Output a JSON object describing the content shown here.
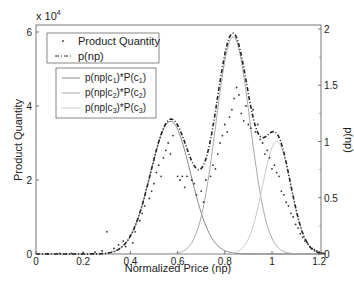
{
  "chart_data": {
    "type": "line",
    "title": "",
    "xlabel": "Normalized  Price (np)",
    "ylabel": "Product Quantity",
    "ylabel_right": "p(np)",
    "y_multiplier": "x 10^4",
    "xlim": [
      0,
      1.23
    ],
    "ylim": [
      0,
      6.2
    ],
    "ylim_right": [
      0,
      2.1
    ],
    "x_ticks": [
      "0",
      "0.2",
      "0.4",
      "0.6",
      "0.8",
      "1",
      "1.2"
    ],
    "y_ticks": [
      "0",
      "2",
      "4",
      "6"
    ],
    "y_ticks_right": [
      "0",
      "0.5",
      "1",
      "1.5",
      "2"
    ],
    "grid": false,
    "legend": [
      {
        "label": "Product Quantity",
        "style": "dot"
      },
      {
        "label": "p(np)",
        "style": "dash-dot"
      }
    ],
    "legend2": [
      {
        "label": "p(np|c1)*P(c1)",
        "style": "solid",
        "color": "#888888"
      },
      {
        "label": "p(np|c2)*P(c2)",
        "style": "solid",
        "color": "#a8a8a8"
      },
      {
        "label": "p(np|c3)*P(c3)",
        "style": "solid",
        "color": "#c8c8c8"
      }
    ],
    "components": [
      {
        "name": "p(np|c1)*P(c1)",
        "mean": 0.57,
        "sigma": 0.085,
        "peak": 1.18
      },
      {
        "name": "p(np|c2)*P(c2)",
        "mean": 0.835,
        "sigma": 0.072,
        "peak": 1.93
      },
      {
        "name": "p(np|c3)*P(c3)",
        "mean": 1.02,
        "sigma": 0.06,
        "peak": 1.0
      }
    ],
    "series": [
      {
        "name": "Product Quantity",
        "axis": "left",
        "unit": "x 10^4",
        "points": [
          [
            0.05,
            0.01
          ],
          [
            0.1,
            0.02
          ],
          [
            0.15,
            0.02
          ],
          [
            0.2,
            0.03
          ],
          [
            0.25,
            0.05
          ],
          [
            0.28,
            0.08
          ],
          [
            0.3,
            0.6
          ],
          [
            0.33,
            0.15
          ],
          [
            0.35,
            0.25
          ],
          [
            0.37,
            0.35
          ],
          [
            0.38,
            0.2
          ],
          [
            0.4,
            0.5
          ],
          [
            0.41,
            0.3
          ],
          [
            0.42,
            0.6
          ],
          [
            0.44,
            0.9
          ],
          [
            0.45,
            1.1
          ],
          [
            0.46,
            1.3
          ],
          [
            0.48,
            1.5
          ],
          [
            0.49,
            1.7
          ],
          [
            0.5,
            1.9
          ],
          [
            0.51,
            2.2
          ],
          [
            0.52,
            2.4
          ],
          [
            0.53,
            2.1
          ],
          [
            0.54,
            2.6
          ],
          [
            0.55,
            2.8
          ],
          [
            0.56,
            3.0
          ],
          [
            0.57,
            2.7
          ],
          [
            0.58,
            3.2
          ],
          [
            0.6,
            2.1
          ],
          [
            0.61,
            2.0
          ],
          [
            0.62,
            2.1
          ],
          [
            0.63,
            1.8
          ],
          [
            0.64,
            2.1
          ],
          [
            0.66,
            2.0
          ],
          [
            0.67,
            1.9
          ],
          [
            0.68,
            1.6
          ],
          [
            0.7,
            1.7
          ],
          [
            0.71,
            1.4
          ],
          [
            0.72,
            2.0
          ],
          [
            0.74,
            2.1
          ],
          [
            0.75,
            2.4
          ],
          [
            0.76,
            2.3
          ],
          [
            0.77,
            2.7
          ],
          [
            0.78,
            3.0
          ],
          [
            0.79,
            3.2
          ],
          [
            0.8,
            3.5
          ],
          [
            0.81,
            3.3
          ],
          [
            0.82,
            3.7
          ],
          [
            0.83,
            3.9
          ],
          [
            0.84,
            4.2
          ],
          [
            0.85,
            4.5
          ],
          [
            0.86,
            4.3
          ],
          [
            0.87,
            3.8
          ],
          [
            0.88,
            3.6
          ],
          [
            0.89,
            4.0
          ],
          [
            0.9,
            3.5
          ],
          [
            0.91,
            3.4
          ],
          [
            0.92,
            3.9
          ],
          [
            0.93,
            3.3
          ],
          [
            0.94,
            3.5
          ],
          [
            0.95,
            3.1
          ],
          [
            0.96,
            3.0
          ],
          [
            0.97,
            2.7
          ],
          [
            0.98,
            2.8
          ],
          [
            0.99,
            2.6
          ],
          [
            1.0,
            2.3
          ],
          [
            1.01,
            2.4
          ],
          [
            1.02,
            2.2
          ],
          [
            1.03,
            2.1
          ],
          [
            1.04,
            1.7
          ],
          [
            1.05,
            1.6
          ],
          [
            1.06,
            1.4
          ],
          [
            1.07,
            1.3
          ],
          [
            1.08,
            1.1
          ],
          [
            1.09,
            1.0
          ],
          [
            1.1,
            0.8
          ],
          [
            1.11,
            0.7
          ],
          [
            1.12,
            0.55
          ],
          [
            1.13,
            0.45
          ],
          [
            1.14,
            0.35
          ],
          [
            1.15,
            0.3
          ],
          [
            1.16,
            0.2
          ],
          [
            1.17,
            0.15
          ],
          [
            1.18,
            0.12
          ],
          [
            1.19,
            0.08
          ],
          [
            1.2,
            0.05
          ],
          [
            1.21,
            0.03
          ],
          [
            1.22,
            0.02
          ]
        ]
      },
      {
        "name": "p(np)",
        "axis": "right",
        "description": "sum of the three weighted components"
      }
    ]
  }
}
